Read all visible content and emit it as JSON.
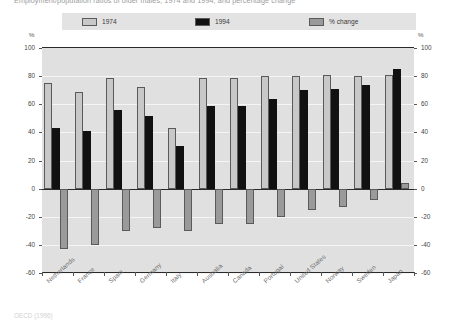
{
  "chart_data": {
    "type": "bar",
    "title": "Employment/population ratios of older males, 1974 and 1994, and percentage change",
    "xlabel": "",
    "ylabel": "%",
    "ylim": [
      -60,
      100
    ],
    "yticks": [
      100,
      80,
      60,
      40,
      20,
      0,
      -20,
      -40,
      -60
    ],
    "ytick_labels": [
      "100",
      "80",
      "60",
      "40",
      "20",
      "0",
      "-20",
      "-40",
      "-60"
    ],
    "axis_unit_left": "%",
    "axis_unit_right": "%",
    "grid": true,
    "legend_position": "top",
    "categories": [
      "Netherlands",
      "France",
      "Spain",
      "Germany",
      "Italy",
      "Australia",
      "Canada",
      "Portugal",
      "United States",
      "Norway",
      "Sweden",
      "Japan"
    ],
    "series": [
      {
        "name": "1974",
        "color": "#c8c8c8",
        "values": [
          75,
          69,
          79,
          72,
          43,
          79,
          79,
          80,
          80,
          81,
          80,
          81
        ]
      },
      {
        "name": "1994",
        "color": "#111111",
        "values": [
          43,
          41,
          56,
          52,
          30,
          59,
          59,
          64,
          70,
          71,
          74,
          85
        ]
      },
      {
        "name": "% change",
        "color": "#9a9a9a",
        "values": [
          -43,
          -40,
          -30,
          -28,
          -30,
          -25,
          -25,
          -20,
          -15,
          -13,
          -8,
          4
        ]
      }
    ]
  },
  "legend": {
    "items": [
      {
        "label": "1974"
      },
      {
        "label": "1994"
      },
      {
        "label": "% change"
      }
    ]
  },
  "source": {
    "note": "OECD (1996)"
  },
  "colors": {
    "plot_background": "#e0e0e0",
    "legend_background": "#e3e3e3",
    "gridline": "#f5f5f5",
    "axis": "#2a2a2a",
    "series_1974": "#c8c8c8",
    "series_1994": "#111111",
    "series_change": "#9a9a9a"
  }
}
